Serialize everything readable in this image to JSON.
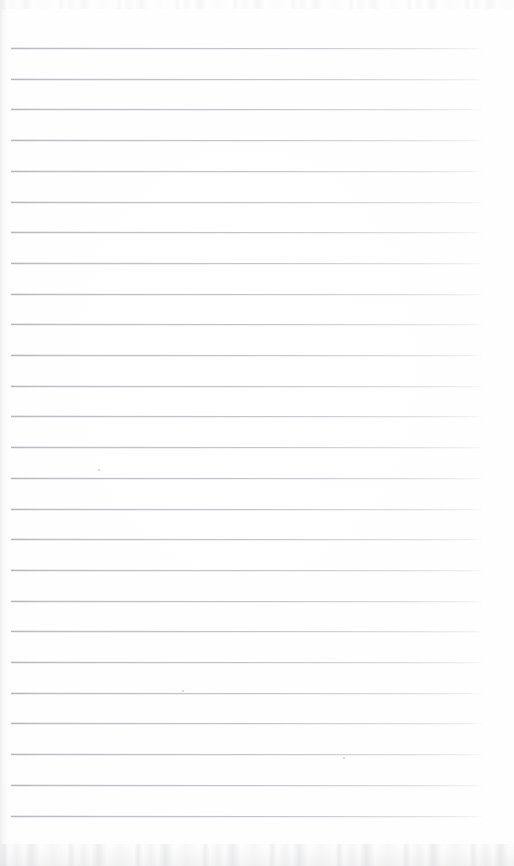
{
  "document": {
    "kind": "scanned-ruled-notebook-page",
    "title": "Blank Ruled Page",
    "written_content": "",
    "page_width": 514,
    "page_height": 866,
    "background_color": "#fefefe"
  },
  "ruling": {
    "line_color": "#b4b8be",
    "line_color_dark_end": "#969aa0",
    "line_thickness": 1,
    "line_count": 26,
    "first_line_y": 48,
    "line_spacing": 30.7,
    "left_margin_x": 11,
    "right_end_x": 482,
    "line_width": 471
  },
  "artifacts": {
    "top_noise_band_height": 9,
    "bottom_noise_band_height": 22,
    "gutter_shade_width": 9,
    "specks": [
      {
        "x": 182,
        "y": 690
      },
      {
        "x": 343,
        "y": 757
      },
      {
        "x": 98,
        "y": 469
      }
    ]
  }
}
